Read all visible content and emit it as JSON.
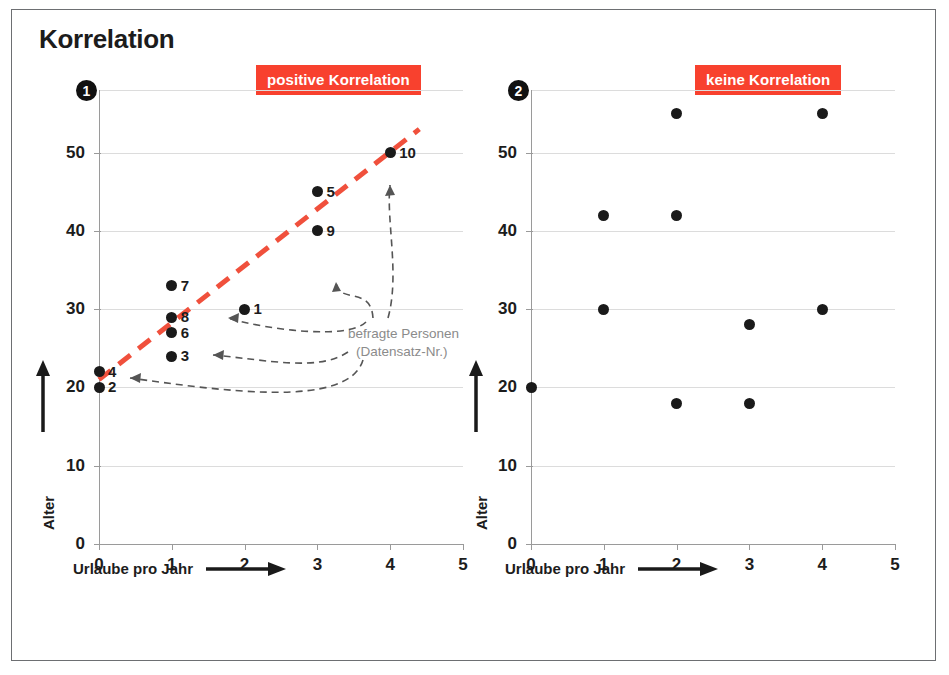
{
  "title": "Korrelation",
  "panels": [
    {
      "number": "1",
      "tag": "positive Korrelation",
      "xlabel": "Urlaube pro Jahr",
      "ylabel": "Alter",
      "note_line1": "befragte Personen",
      "note_line2": "(Datensatz-Nr.)"
    },
    {
      "number": "2",
      "tag": "keine Korrelation",
      "xlabel": "Urlaube pro Jahr",
      "ylabel": "Alter"
    }
  ],
  "chart_data": [
    {
      "type": "scatter",
      "title": "positive Korrelation",
      "xlabel": "Urlaube pro Jahr",
      "ylabel": "Alter",
      "xlim": [
        0,
        5
      ],
      "ylim": [
        0,
        58
      ],
      "xticks": [
        "0",
        "1",
        "2",
        "3",
        "4",
        "5"
      ],
      "yticks": [
        "0",
        "10",
        "20",
        "30",
        "40",
        "50"
      ],
      "grid": true,
      "legend": "none",
      "points": [
        {
          "label": "1",
          "x": 2,
          "y": 30
        },
        {
          "label": "2",
          "x": 0,
          "y": 20
        },
        {
          "label": "3",
          "x": 1,
          "y": 24
        },
        {
          "label": "4",
          "x": 0,
          "y": 22
        },
        {
          "label": "5",
          "x": 3,
          "y": 45
        },
        {
          "label": "6",
          "x": 1,
          "y": 27
        },
        {
          "label": "7",
          "x": 1,
          "y": 33
        },
        {
          "label": "8",
          "x": 1,
          "y": 29
        },
        {
          "label": "9",
          "x": 3,
          "y": 40
        },
        {
          "label": "10",
          "x": 4,
          "y": 50
        }
      ],
      "trendline": {
        "x0": 0,
        "y0": 21,
        "x1": 4.4,
        "y1": 53,
        "style": "dashed",
        "color": "#F0503C"
      },
      "annotations": [
        "befragte Personen",
        "(Datensatz-Nr.)"
      ]
    },
    {
      "type": "scatter",
      "title": "keine Korrelation",
      "xlabel": "Urlaube pro Jahr",
      "ylabel": "Alter",
      "xlim": [
        0,
        5
      ],
      "ylim": [
        0,
        58
      ],
      "xticks": [
        "0",
        "1",
        "2",
        "3",
        "4",
        "5"
      ],
      "yticks": [
        "0",
        "10",
        "20",
        "30",
        "40",
        "50"
      ],
      "grid": true,
      "legend": "none",
      "points": [
        {
          "x": 0,
          "y": 20
        },
        {
          "x": 1,
          "y": 30
        },
        {
          "x": 1,
          "y": 42
        },
        {
          "x": 2,
          "y": 18
        },
        {
          "x": 2,
          "y": 42
        },
        {
          "x": 2,
          "y": 55
        },
        {
          "x": 3,
          "y": 18
        },
        {
          "x": 3,
          "y": 28
        },
        {
          "x": 4,
          "y": 30
        },
        {
          "x": 4,
          "y": 55
        }
      ],
      "trendline": null
    }
  ],
  "colors": {
    "accent_red": "#F8412E",
    "trend_red": "#F0503C",
    "dot": "#1a1a1a",
    "grid": "#dcdcdc",
    "axis": "#9a9a9a",
    "note_gray": "#8b8b8b"
  }
}
